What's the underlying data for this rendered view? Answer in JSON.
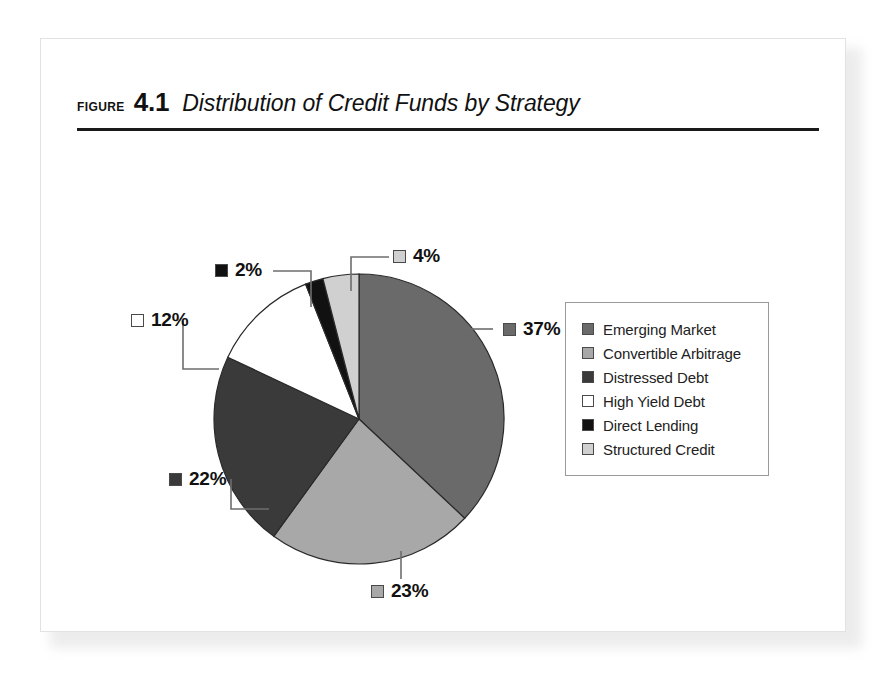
{
  "figure": {
    "label": "FIGURE",
    "number": "4.1",
    "caption": "Distribution of Credit Funds by Strategy"
  },
  "legend": {
    "items": [
      {
        "label": "Emerging Market",
        "color": "#6a6a6a"
      },
      {
        "label": "Convertible Arbitrage",
        "color": "#a8a8a8"
      },
      {
        "label": "Distressed Debt",
        "color": "#3a3a3a"
      },
      {
        "label": "High Yield Debt",
        "color": "#ffffff"
      },
      {
        "label": "Direct Lending",
        "color": "#111111"
      },
      {
        "label": "Structured Credit",
        "color": "#d0d0d0"
      }
    ]
  },
  "callouts": [
    {
      "pct": "37%",
      "color": "#6a6a6a"
    },
    {
      "pct": "23%",
      "color": "#a8a8a8"
    },
    {
      "pct": "22%",
      "color": "#3a3a3a"
    },
    {
      "pct": "12%",
      "color": "#ffffff"
    },
    {
      "pct": "2%",
      "color": "#111111"
    },
    {
      "pct": "4%",
      "color": "#d0d0d0"
    }
  ],
  "chart_data": {
    "type": "pie",
    "title": "Distribution of Credit Funds by Strategy",
    "xlabel": "",
    "ylabel": "",
    "grid": false,
    "legend_position": "right",
    "start_angle_deg": 0,
    "direction": "clockwise",
    "units": "percent",
    "total": 100,
    "categories": [
      "Emerging Market",
      "Convertible Arbitrage",
      "Distressed Debt",
      "High Yield Debt",
      "Direct Lending",
      "Structured Credit"
    ],
    "values": [
      37,
      23,
      22,
      12,
      2,
      4
    ],
    "data_labels": [
      "37%",
      "23%",
      "22%",
      "12%",
      "2%",
      "4%"
    ],
    "colors": [
      "#6a6a6a",
      "#a8a8a8",
      "#3a3a3a",
      "#ffffff",
      "#111111",
      "#d0d0d0"
    ],
    "slices": [
      {
        "label": "Emerging Market",
        "value": 37,
        "data_label": "37%",
        "color": "#6a6a6a"
      },
      {
        "label": "Convertible Arbitrage",
        "value": 23,
        "data_label": "23%",
        "color": "#a8a8a8"
      },
      {
        "label": "Distressed Debt",
        "value": 22,
        "data_label": "22%",
        "color": "#3a3a3a"
      },
      {
        "label": "High Yield Debt",
        "value": 12,
        "data_label": "12%",
        "color": "#ffffff"
      },
      {
        "label": "Direct Lending",
        "value": 2,
        "data_label": "2%",
        "color": "#111111"
      },
      {
        "label": "Structured Credit",
        "value": 4,
        "data_label": "4%",
        "color": "#d0d0d0"
      }
    ]
  }
}
